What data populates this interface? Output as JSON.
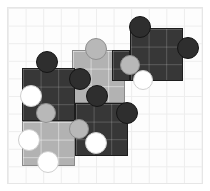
{
  "scene": {
    "title": "Jigsaw puzzle assembly",
    "background_color": "#ffffff",
    "board": {
      "frame_color": "#e6e6e6",
      "grid_line_color": "#ededed",
      "grid_cell_px": 17.6,
      "cols": 11,
      "rows": 10
    },
    "palette": {
      "dark_piece": "#373737",
      "light_piece": "#b2b2b2",
      "dark_knob": "#2e2e2e",
      "gray_knob": "#b8b8b8",
      "white_knob": "#ffffff"
    },
    "piece_count": 6,
    "pieces": [
      {
        "id": "piece-top-right",
        "shade": "dark",
        "label": "dark piece top right",
        "x": 130,
        "y": 28,
        "w": 53,
        "h": 53
      },
      {
        "id": "piece-center-light",
        "shade": "light",
        "label": "light piece center",
        "x": 72,
        "y": 50,
        "w": 53,
        "h": 53
      },
      {
        "id": "piece-left-dark",
        "shade": "dark",
        "label": "dark piece left",
        "x": 22,
        "y": 68,
        "w": 53,
        "h": 53
      },
      {
        "id": "piece-mid-dark",
        "shade": "dark",
        "label": "dark piece middle",
        "x": 75,
        "y": 103,
        "w": 53,
        "h": 53
      },
      {
        "id": "piece-bottom-light",
        "shade": "light",
        "label": "light piece bottom left",
        "x": 22,
        "y": 121,
        "w": 53,
        "h": 45
      },
      {
        "id": "piece-upper-dark",
        "shade": "dark",
        "label": "dark piece upper left",
        "x": 112,
        "y": 50,
        "w": 18,
        "h": 31
      }
    ],
    "knobs": [
      {
        "id": "knob-1",
        "type": "dark",
        "label": "dark knob top of top-right piece",
        "cx": 140,
        "cy": 27,
        "r": 11
      },
      {
        "id": "knob-2",
        "type": "dark",
        "label": "dark knob right of top-right piece",
        "cx": 188,
        "cy": 48,
        "r": 11
      },
      {
        "id": "knob-3",
        "type": "gray",
        "label": "gray knob left of top-right piece",
        "cx": 130,
        "cy": 65,
        "r": 10
      },
      {
        "id": "knob-4",
        "type": "white",
        "label": "white hole in top-right piece",
        "cx": 143,
        "cy": 80,
        "r": 10
      },
      {
        "id": "knob-5",
        "type": "gray",
        "label": "gray knob top of center piece",
        "cx": 96,
        "cy": 49,
        "r": 11
      },
      {
        "id": "knob-6",
        "type": "dark",
        "label": "dark knob left of center piece",
        "cx": 80,
        "cy": 79,
        "r": 11
      },
      {
        "id": "knob-7",
        "type": "dark",
        "label": "dark knob bottom of center piece",
        "cx": 97,
        "cy": 96,
        "r": 11
      },
      {
        "id": "knob-8",
        "type": "dark",
        "label": "dark knob top of left piece",
        "cx": 47,
        "cy": 62,
        "r": 11
      },
      {
        "id": "knob-9",
        "type": "white",
        "label": "white hole in left piece",
        "cx": 31,
        "cy": 96,
        "r": 11
      },
      {
        "id": "knob-10",
        "type": "gray",
        "label": "gray knob bottom of left piece",
        "cx": 46,
        "cy": 113,
        "r": 10
      },
      {
        "id": "knob-11",
        "type": "dark",
        "label": "dark knob right of middle piece",
        "cx": 127,
        "cy": 113,
        "r": 11
      },
      {
        "id": "knob-12",
        "type": "gray",
        "label": "gray knob left of middle piece",
        "cx": 79,
        "cy": 129,
        "r": 10
      },
      {
        "id": "knob-13",
        "type": "white",
        "label": "white hole in middle piece",
        "cx": 96,
        "cy": 143,
        "r": 11
      },
      {
        "id": "knob-14",
        "type": "white",
        "label": "white hole left of bottom piece",
        "cx": 29,
        "cy": 140,
        "r": 11
      },
      {
        "id": "knob-15",
        "type": "white",
        "label": "white hole bottom of bottom piece",
        "cx": 48,
        "cy": 162,
        "r": 11
      }
    ]
  }
}
